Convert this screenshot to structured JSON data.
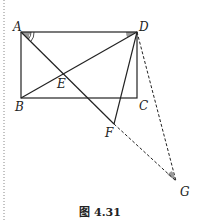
{
  "figure": {
    "caption": "图 4.31",
    "colors": {
      "line": "#222222",
      "angle_fill": "#999999",
      "border": "#888888"
    },
    "points": {
      "A": {
        "label": "A",
        "x": 21,
        "y": 32
      },
      "B": {
        "label": "B",
        "x": 21,
        "y": 98
      },
      "C": {
        "label": "C",
        "x": 137,
        "y": 98
      },
      "D": {
        "label": "D",
        "x": 137,
        "y": 32
      },
      "E": {
        "label": "E",
        "x": 63,
        "y": 73
      },
      "F": {
        "label": "F",
        "x": 114,
        "y": 124
      },
      "G": {
        "label": "G",
        "x": 176,
        "y": 181
      }
    },
    "solid_segments": [
      "AB",
      "BC",
      "CD",
      "DA",
      "BD",
      "AF",
      "DF"
    ],
    "dashed_segments": [
      "FG",
      "DG"
    ],
    "marked_angles": [
      "DAF (double arc)",
      "ADB",
      "DGF"
    ]
  }
}
